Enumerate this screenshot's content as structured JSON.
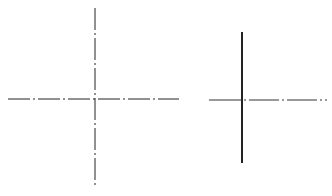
{
  "diagram": {
    "colors": {
      "background": "#ffffff",
      "line": "#222222"
    },
    "figures": [
      {
        "name": "left-crosshair",
        "vertical_style": "dash-dot",
        "horizontal_style": "dash-dot"
      },
      {
        "name": "right-crosshair",
        "vertical_style": "solid-thick",
        "horizontal_left_style": "solid",
        "horizontal_right_style": "dash-dot"
      }
    ]
  }
}
